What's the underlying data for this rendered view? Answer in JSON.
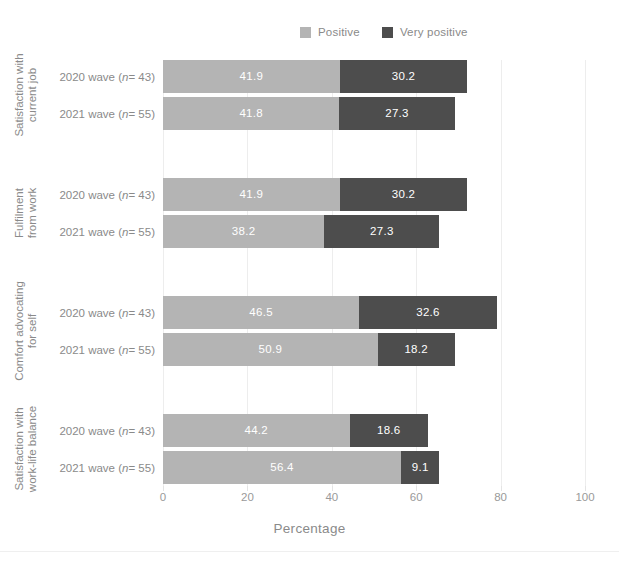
{
  "chart_data": {
    "type": "bar",
    "orientation": "horizontal",
    "stacked": true,
    "title": "",
    "xlabel": "Percentage",
    "ylabel": "",
    "xlim": [
      0,
      100
    ],
    "xticks": [
      0,
      20,
      40,
      60,
      80,
      100
    ],
    "grid": "vertical",
    "legend_position": "top",
    "legend": [
      "Positive",
      "Very positive"
    ],
    "colors": {
      "positive": "#b4b4b4",
      "very_positive": "#4d4d4d",
      "background": "#ffffff",
      "gridline": "#ededed",
      "text": "#8a8a8a"
    },
    "categories": [
      "Satisfaction with current job",
      "Fulfilment from work",
      "Comfort advocating for self",
      "Satisfaction with work-life balance"
    ],
    "groups": [
      {
        "category": "Satisfaction with current job",
        "category_line1": "Satisfaction with",
        "category_line2": "current job",
        "bars": [
          {
            "wave": "2020 wave",
            "n": "43",
            "positive": 41.9,
            "very_positive": 30.2
          },
          {
            "wave": "2021 wave",
            "n": "55",
            "positive": 41.8,
            "very_positive": 27.3
          }
        ]
      },
      {
        "category": "Fulfilment from work",
        "category_line1": "Fulfilment",
        "category_line2": "from work",
        "bars": [
          {
            "wave": "2020 wave",
            "n": "43",
            "positive": 41.9,
            "very_positive": 30.2
          },
          {
            "wave": "2021 wave",
            "n": "55",
            "positive": 38.2,
            "very_positive": 27.3
          }
        ]
      },
      {
        "category": "Comfort advocating for self",
        "category_line1": "Comfort advocating",
        "category_line2": "for self",
        "bars": [
          {
            "wave": "2020 wave",
            "n": "43",
            "positive": 46.5,
            "very_positive": 32.6
          },
          {
            "wave": "2021 wave",
            "n": "55",
            "positive": 50.9,
            "very_positive": 18.2
          }
        ]
      },
      {
        "category": "Satisfaction with work-life balance",
        "category_line1": "Satisfaction with",
        "category_line2": "work-life balance",
        "bars": [
          {
            "wave": "2020 wave",
            "n": "43",
            "positive": 44.2,
            "very_positive": 18.6
          },
          {
            "wave": "2021 wave",
            "n": "55",
            "positive": 56.4,
            "very_positive": 9.1
          }
        ]
      }
    ]
  }
}
